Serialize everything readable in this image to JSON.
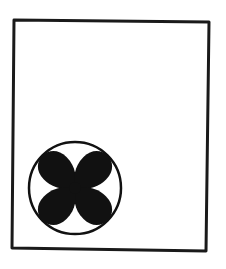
{
  "figure": {
    "panel": {
      "shape": "rectangle",
      "corners": [
        [
          14,
          20
        ],
        [
          209,
          22
        ],
        [
          206,
          251
        ],
        [
          12,
          248
        ]
      ],
      "stroke_color": "#1a1a1a",
      "stroke_width": 3
    },
    "fan_symbol": {
      "icon": "fan-icon",
      "circle": {
        "cx": 75,
        "cy": 188,
        "r": 46,
        "stroke_color": "#111111",
        "stroke_width": 2.5
      },
      "blades": 4,
      "blade_angles_deg": [
        45,
        135,
        225,
        315
      ],
      "blade_color": "#111111"
    },
    "background_color": "#ffffff"
  }
}
